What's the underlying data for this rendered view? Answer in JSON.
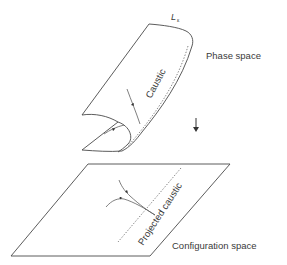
{
  "figure": {
    "labels": {
      "manifold": "L",
      "manifold_subscript": "ε",
      "phase_space": "Phase space",
      "caustic": "Caustic",
      "projected_caustic": "Projected caustic",
      "configuration_space": "Configuration space"
    },
    "icons": {
      "projection_arrow": "down-arrow"
    },
    "colors": {
      "line": "#4a4a4a",
      "text": "#3a3a3a",
      "background": "#ffffff"
    }
  }
}
